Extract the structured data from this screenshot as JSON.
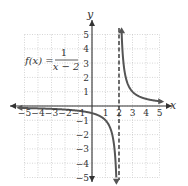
{
  "chart_data": {
    "type": "line",
    "title": "",
    "function_label": {
      "lhs": "f(x) =",
      "numerator": "1",
      "denominator": "x − 2"
    },
    "xlabel": "x",
    "ylabel": "y",
    "xlim": [
      -5,
      5
    ],
    "ylim": [
      -5,
      5
    ],
    "grid": true,
    "x_ticks": [
      "−5",
      "−4",
      "−3",
      "−2",
      "−1",
      "1",
      "2",
      "3",
      "4",
      "5"
    ],
    "y_ticks": [
      "5",
      "4",
      "3",
      "2",
      "1",
      "−1",
      "−2",
      "−3",
      "−4",
      "−5"
    ],
    "asymptotes": {
      "vertical": {
        "x": 2,
        "style": "dashed"
      },
      "horizontal": {
        "y": 0
      }
    },
    "series": [
      {
        "name": "left branch",
        "x": [
          -5,
          -4,
          -3,
          -2,
          -1,
          0,
          1,
          1.5,
          1.75,
          1.8
        ],
        "y": [
          -0.14,
          -0.17,
          -0.2,
          -0.25,
          -0.33,
          -0.5,
          -1,
          -2,
          -4,
          -5
        ]
      },
      {
        "name": "right branch",
        "x": [
          2.2,
          2.25,
          2.5,
          3,
          4,
          5
        ],
        "y": [
          5,
          4,
          2,
          1,
          0.5,
          0.33
        ]
      }
    ],
    "colors": {
      "curve": "#555555",
      "axis": "#333333",
      "grid": "#bbbbbb"
    }
  }
}
